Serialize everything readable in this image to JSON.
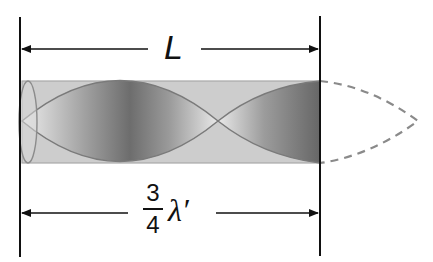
{
  "diagram": {
    "title": "",
    "top_dimension": {
      "label": "L"
    },
    "bottom_dimension": {
      "numerator": "3",
      "denominator": "4",
      "symbol": "λ′"
    },
    "tube": {
      "description": "open-closed pipe with standing wave, three-quarter wavelength shown"
    },
    "colors": {
      "line": "#111111",
      "tube_fill": "#c8c8c8",
      "wave_dark": "#6a6a6a",
      "dashed": "#888888"
    }
  }
}
